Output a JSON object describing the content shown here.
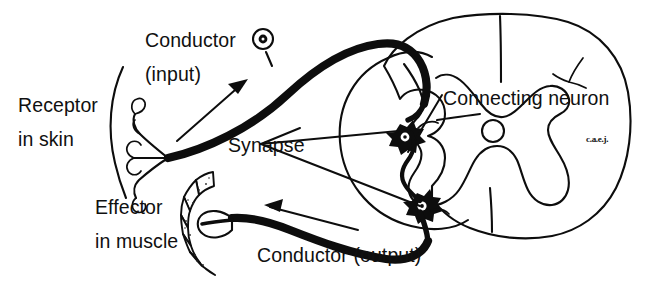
{
  "figure": {
    "background_color": "#ffffff",
    "ink_color": "#0d0d0d",
    "width": 645,
    "height": 301
  },
  "labels": {
    "conductor_input_line1": "Conductor",
    "conductor_input_line2": "(input)",
    "receptor_line1": "Receptor",
    "receptor_line2": "in skin",
    "synapse": "Synapse",
    "connecting_neuron": "Connecting neuron",
    "effector_line1": "Effector",
    "effector_line2": "in muscle",
    "conductor_output": "Conductor (output)",
    "signature": "c.a.e.j."
  },
  "parts": {
    "skin_surface": "skin-surface-arc",
    "receptor_endings": "sensory-receptor-endings",
    "ganglion_cell_body": "dorsal-root-ganglion",
    "sensory_nerve": "sensory-conductor-fiber",
    "motor_nerve": "motor-conductor-fiber",
    "muscle_effector": "striated-muscle-effector",
    "spinal_cord": "spinal-cord-cross-section",
    "central_canal": "central-canal",
    "gray_matter": "gray-matter-butterfly",
    "synapse_upper": "upper-synapse-neuron-body",
    "synapse_lower": "lower-synapse-neuron-body",
    "interneuron": "connecting-neuron-fiber",
    "input_arrow": "input-direction-arrow",
    "output_arrow": "output-direction-arrow"
  }
}
